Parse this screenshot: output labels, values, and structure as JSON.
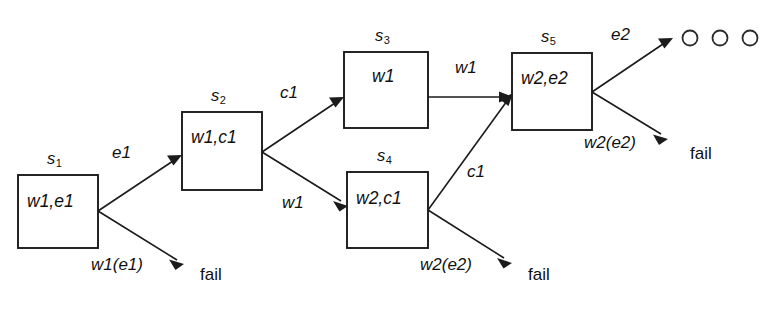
{
  "diagram": {
    "type": "state-transition-tree",
    "canvas": {
      "width": 772,
      "height": 311,
      "background": "#ffffff"
    },
    "ink_color": "#1b1b1b",
    "states": [
      {
        "id": "s1",
        "name": "s",
        "subscript": "1",
        "contents": "w1,e1",
        "x": 18,
        "y": 175,
        "w": 80,
        "h": 73
      },
      {
        "id": "s2",
        "name": "s",
        "subscript": "2",
        "contents": "w1,c1",
        "x": 182,
        "y": 112,
        "w": 80,
        "h": 78
      },
      {
        "id": "s3",
        "name": "s",
        "subscript": "3",
        "contents": "w1",
        "x": 344,
        "y": 52,
        "w": 84,
        "h": 76
      },
      {
        "id": "s4",
        "name": "s",
        "subscript": "4",
        "contents": "w2,c1",
        "x": 347,
        "y": 172,
        "w": 81,
        "h": 76
      },
      {
        "id": "s5",
        "name": "s",
        "subscript": "5",
        "contents": "w2,e2",
        "x": 512,
        "y": 53,
        "w": 80,
        "h": 77
      }
    ],
    "edges": [
      {
        "id": "e-s1-s2",
        "label": "e1",
        "from": "s1",
        "to": "s2",
        "kind": "success"
      },
      {
        "id": "e-s1-fail1",
        "label": "w1(e1)",
        "from": "s1",
        "to": "fail1",
        "kind": "failure"
      },
      {
        "id": "e-s2-s3",
        "label": "c1",
        "from": "s2",
        "to": "s3",
        "kind": "success"
      },
      {
        "id": "e-s2-s4",
        "label": "w1",
        "from": "s2",
        "to": "s4",
        "kind": "success"
      },
      {
        "id": "e-s3-s5",
        "label": "w1",
        "from": "s3",
        "to": "s5",
        "kind": "success"
      },
      {
        "id": "e-s4-s5",
        "label": "c1",
        "from": "s4",
        "to": "s5",
        "kind": "success"
      },
      {
        "id": "e-s4-fail2",
        "label": "w2(e2)",
        "from": "s4",
        "to": "fail2",
        "kind": "failure"
      },
      {
        "id": "e-s5-out",
        "label": "e2",
        "from": "s5",
        "to": "outcomes",
        "kind": "success"
      },
      {
        "id": "e-s5-fail3",
        "label": "w2(e2)",
        "from": "s5",
        "to": "fail3",
        "kind": "failure"
      }
    ],
    "fail_nodes": [
      {
        "id": "fail1",
        "label": "fail",
        "x": 200,
        "y": 267
      },
      {
        "id": "fail2",
        "label": "fail",
        "x": 528,
        "y": 267
      },
      {
        "id": "fail3",
        "label": "fail",
        "x": 690,
        "y": 146
      }
    ],
    "outcome_circles": [
      {
        "cx": 690,
        "cy": 38,
        "r": 7.5
      },
      {
        "cx": 720,
        "cy": 38,
        "r": 7.5
      },
      {
        "cx": 750,
        "cy": 38,
        "r": 7.5
      }
    ],
    "labels": {
      "s1_name": "s",
      "s1_sub": "1",
      "s1_contents": "w1,e1",
      "s2_name": "s",
      "s2_sub": "2",
      "s2_contents": "w1,c1",
      "s3_name": "s",
      "s3_sub": "3",
      "s3_contents": "w1",
      "s4_name": "s",
      "s4_sub": "4",
      "s4_contents": "w2,c1",
      "s5_name": "s",
      "s5_sub": "5",
      "s5_contents": "w2,e2",
      "edge_e1": "e1",
      "edge_w1e1_a": "w1",
      "edge_w1e1_b": "(e1)",
      "edge_c1_s2s3": "c1",
      "edge_w1_s2s4": "w1",
      "edge_w1_s3s5": "w1",
      "edge_c1_s4s5": "c1",
      "edge_w2e2_s4_a": "w2",
      "edge_w2e2_s4_b": "(e2)",
      "edge_e2": "e2",
      "edge_w2e2_s5_a": "w2",
      "edge_w2e2_s5_b": "(e2)",
      "fail1": "fail",
      "fail2": "fail",
      "fail3": "fail"
    }
  }
}
